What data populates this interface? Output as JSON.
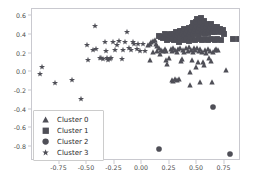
{
  "figure": {
    "width": 254,
    "height": 184,
    "background": "#ffffff",
    "marker_color": "#4f4f57",
    "axis_color": "#c9c9cf",
    "tick_label_color": "#4d4d4d"
  },
  "legend": {
    "position": "lower left",
    "entries": [
      {
        "label": "Cluster 0",
        "marker": "triangle-marker",
        "color": "#4f4f57"
      },
      {
        "label": "Cluster 1",
        "marker": "square-marker",
        "color": "#4f4f57"
      },
      {
        "label": "Cluster 2",
        "marker": "circle-marker",
        "color": "#4f4f57"
      },
      {
        "label": "Cluster 3",
        "marker": "star-marker",
        "color": "#4f4f57"
      }
    ]
  },
  "chart_data": {
    "type": "scatter",
    "title": "",
    "xlabel": "",
    "ylabel": "",
    "xlim": [
      -1.0,
      0.9
    ],
    "ylim": [
      -0.95,
      0.68
    ],
    "grid": false,
    "legend_position": "lower left",
    "xticks": [
      -0.75,
      -0.5,
      -0.25,
      0.0,
      0.25,
      0.5,
      0.75
    ],
    "xticklabels": [
      "-0.75",
      "-0.50",
      "-0.25",
      "0.00",
      "0.25",
      "0.50",
      "0.75"
    ],
    "yticks": [
      0.6,
      0.4,
      0.2,
      0.0,
      -0.2,
      -0.4,
      -0.6,
      -0.8
    ],
    "yticklabels": [
      "0.6",
      "0.4",
      "0.2",
      "0.0",
      "-0.2",
      "-0.4",
      "-0.6",
      "-0.8"
    ],
    "series": [
      {
        "name": "Cluster 0",
        "marker": "triangle",
        "color": "#4f4f57",
        "points": [
          [
            0.055,
            0.29
          ],
          [
            0.07,
            0.305
          ],
          [
            0.085,
            0.325
          ],
          [
            0.1,
            0.335
          ],
          [
            0.115,
            0.35
          ],
          [
            0.125,
            0.3
          ],
          [
            0.14,
            0.28
          ],
          [
            0.155,
            0.265
          ],
          [
            0.07,
            0.135
          ],
          [
            0.1,
            0.215
          ],
          [
            0.135,
            0.225
          ],
          [
            0.16,
            0.2
          ],
          [
            0.175,
            0.24
          ],
          [
            0.19,
            0.225
          ],
          [
            0.205,
            0.255
          ],
          [
            0.22,
            0.235
          ],
          [
            0.23,
            0.085
          ],
          [
            0.245,
            0.15
          ],
          [
            0.26,
            0.25
          ],
          [
            0.275,
            0.23
          ],
          [
            0.285,
            0.265
          ],
          [
            0.3,
            0.245
          ],
          [
            0.315,
            0.22
          ],
          [
            0.33,
            0.255
          ],
          [
            0.345,
            0.265
          ],
          [
            0.355,
            0.125
          ],
          [
            0.37,
            0.245
          ],
          [
            0.385,
            0.215
          ],
          [
            0.4,
            0.26
          ],
          [
            0.415,
            0.235
          ],
          [
            0.43,
            0.27
          ],
          [
            0.445,
            0.245
          ],
          [
            0.46,
            0.22
          ],
          [
            0.47,
            0.26
          ],
          [
            0.485,
            0.24
          ],
          [
            0.5,
            0.265
          ],
          [
            0.515,
            0.235
          ],
          [
            0.53,
            0.255
          ],
          [
            0.545,
            0.22
          ],
          [
            0.555,
            0.115
          ],
          [
            0.57,
            0.245
          ],
          [
            0.585,
            0.21
          ],
          [
            0.6,
            0.255
          ],
          [
            0.615,
            0.23
          ],
          [
            0.63,
            0.125
          ],
          [
            0.645,
            0.22
          ],
          [
            0.66,
            0.245
          ],
          [
            0.675,
            0.255
          ],
          [
            0.27,
            -0.085
          ],
          [
            0.285,
            -0.09
          ],
          [
            0.3,
            -0.075
          ],
          [
            0.315,
            -0.085
          ],
          [
            0.335,
            -0.075
          ],
          [
            0.44,
            -0.13
          ],
          [
            0.53,
            -0.1
          ],
          [
            0.635,
            -0.1
          ],
          [
            0.435,
            0.005
          ],
          [
            0.49,
            0.06
          ],
          [
            0.505,
            0.115
          ],
          [
            0.765,
            0.025
          ],
          [
            0.22,
            0.135
          ],
          [
            0.36,
            0.145
          ],
          [
            0.455,
            0.135
          ],
          [
            0.56,
            0.075
          ],
          [
            0.605,
            0.155
          ],
          [
            0.69,
            0.245
          ]
        ]
      },
      {
        "name": "Cluster 1",
        "marker": "square",
        "color": "#4f4f57",
        "points": [
          [
            0.225,
            0.39
          ],
          [
            0.245,
            0.4
          ],
          [
            0.26,
            0.41
          ],
          [
            0.275,
            0.395
          ],
          [
            0.29,
            0.415
          ],
          [
            0.305,
            0.43
          ],
          [
            0.3,
            0.38
          ],
          [
            0.315,
            0.4
          ],
          [
            0.33,
            0.425
          ],
          [
            0.345,
            0.445
          ],
          [
            0.345,
            0.385
          ],
          [
            0.36,
            0.41
          ],
          [
            0.37,
            0.44
          ],
          [
            0.385,
            0.465
          ],
          [
            0.385,
            0.395
          ],
          [
            0.4,
            0.42
          ],
          [
            0.41,
            0.45
          ],
          [
            0.425,
            0.48
          ],
          [
            0.425,
            0.4
          ],
          [
            0.435,
            0.43
          ],
          [
            0.445,
            0.46
          ],
          [
            0.455,
            0.49
          ],
          [
            0.46,
            0.525
          ],
          [
            0.465,
            0.41
          ],
          [
            0.475,
            0.44
          ],
          [
            0.485,
            0.47
          ],
          [
            0.49,
            0.5
          ],
          [
            0.495,
            0.54
          ],
          [
            0.5,
            0.575
          ],
          [
            0.505,
            0.415
          ],
          [
            0.51,
            0.445
          ],
          [
            0.52,
            0.475
          ],
          [
            0.525,
            0.505
          ],
          [
            0.53,
            0.545
          ],
          [
            0.535,
            0.585
          ],
          [
            0.545,
            0.42
          ],
          [
            0.55,
            0.45
          ],
          [
            0.555,
            0.485
          ],
          [
            0.56,
            0.515
          ],
          [
            0.565,
            0.55
          ],
          [
            0.575,
            0.425
          ],
          [
            0.58,
            0.455
          ],
          [
            0.585,
            0.49
          ],
          [
            0.59,
            0.52
          ],
          [
            0.6,
            0.425
          ],
          [
            0.61,
            0.46
          ],
          [
            0.615,
            0.49
          ],
          [
            0.625,
            0.515
          ],
          [
            0.635,
            0.43
          ],
          [
            0.645,
            0.46
          ],
          [
            0.65,
            0.49
          ],
          [
            0.665,
            0.435
          ],
          [
            0.675,
            0.465
          ],
          [
            0.685,
            0.49
          ],
          [
            0.695,
            0.44
          ],
          [
            0.705,
            0.465
          ],
          [
            0.72,
            0.43
          ],
          [
            0.735,
            0.455
          ],
          [
            0.745,
            0.415
          ],
          [
            0.38,
            0.345
          ],
          [
            0.4,
            0.355
          ],
          [
            0.43,
            0.34
          ],
          [
            0.455,
            0.355
          ],
          [
            0.485,
            0.345
          ],
          [
            0.515,
            0.36
          ],
          [
            0.545,
            0.345
          ],
          [
            0.575,
            0.355
          ],
          [
            0.6,
            0.345
          ],
          [
            0.63,
            0.355
          ],
          [
            0.66,
            0.345
          ],
          [
            0.685,
            0.36
          ],
          [
            0.715,
            0.345
          ],
          [
            0.34,
            0.33
          ],
          [
            0.295,
            0.345
          ],
          [
            0.265,
            0.355
          ],
          [
            0.23,
            0.345
          ],
          [
            0.195,
            0.365
          ],
          [
            0.175,
            0.385
          ],
          [
            0.155,
            0.395
          ],
          [
            0.205,
            0.41
          ],
          [
            0.825,
            0.355
          ],
          [
            0.885,
            0.355
          ]
        ]
      },
      {
        "name": "Cluster 2",
        "marker": "circle",
        "color": "#4f4f57",
        "points": [
          [
            0.155,
            -0.825
          ],
          [
            0.645,
            -0.37
          ],
          [
            0.8,
            -0.875
          ]
        ]
      },
      {
        "name": "Cluster 3",
        "marker": "star",
        "color": "#4f4f57",
        "points": [
          [
            -0.905,
            0.055
          ],
          [
            -0.925,
            -0.015
          ],
          [
            -0.79,
            -0.115
          ],
          [
            -0.635,
            -0.085
          ],
          [
            -0.555,
            -0.29
          ],
          [
            -0.5,
            0.29
          ],
          [
            -0.49,
            0.13
          ],
          [
            -0.445,
            0.245
          ],
          [
            -0.43,
            0.5
          ],
          [
            -0.42,
            0.255
          ],
          [
            -0.385,
            0.155
          ],
          [
            -0.37,
            0.15
          ],
          [
            -0.355,
            0.145
          ],
          [
            -0.335,
            0.325
          ],
          [
            -0.33,
            0.235
          ],
          [
            -0.315,
            0.15
          ],
          [
            -0.295,
            0.145
          ],
          [
            -0.28,
            0.15
          ],
          [
            -0.265,
            0.33
          ],
          [
            -0.25,
            0.245
          ],
          [
            -0.225,
            0.29
          ],
          [
            -0.205,
            0.335
          ],
          [
            -0.185,
            0.145
          ],
          [
            -0.17,
            0.24
          ],
          [
            -0.155,
            0.325
          ],
          [
            -0.135,
            0.43
          ],
          [
            -0.115,
            0.265
          ],
          [
            -0.1,
            0.245
          ],
          [
            -0.085,
            0.33
          ],
          [
            -0.07,
            0.3
          ],
          [
            -0.05,
            0.255
          ],
          [
            -0.035,
            0.31
          ],
          [
            -0.02,
            0.235
          ],
          [
            0.01,
            0.3
          ],
          [
            0.025,
            0.235
          ],
          [
            -0.31,
            0.13
          ]
        ]
      }
    ]
  }
}
